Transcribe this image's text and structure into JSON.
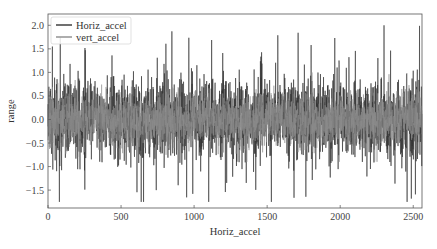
{
  "chart_data": {
    "type": "line",
    "title": "",
    "xlabel": "Horiz_accel",
    "ylabel": "range",
    "xlim": [
      0,
      2560
    ],
    "ylim": [
      -1.88,
      2.24
    ],
    "xticks": [
      0,
      500,
      1000,
      1500,
      2000,
      2500
    ],
    "yticks": [
      -1.5,
      -1.0,
      -0.5,
      0.0,
      0.5,
      1.0,
      1.5,
      2.0
    ],
    "xtick_labels": [
      "0",
      "500",
      "1000",
      "1500",
      "2000",
      "2500"
    ],
    "ytick_labels": [
      "−1.5",
      "−1.0",
      "−0.5",
      "0.0",
      "0.5",
      "1.0",
      "1.5",
      "2.0"
    ],
    "grid": false,
    "legend_position": "upper left",
    "n_points": 2560,
    "series": [
      {
        "name": "Horiz_accel",
        "color": "#333333",
        "summary": {
          "mean": 0.0,
          "typical_range": [
            -1.0,
            1.0
          ],
          "max": 2.0,
          "max_at": 2300,
          "min": -1.75,
          "min_at": 1100
        },
        "generator": {
          "seed": 7,
          "std": 0.42,
          "spike_prob": 0.03,
          "spike_scale": 1.3
        }
      },
      {
        "name": "vert_accel",
        "color": "#8c8c8c",
        "summary": {
          "mean": 0.0,
          "typical_range": [
            -0.6,
            0.6
          ],
          "max": 1.0,
          "min": -0.9
        },
        "generator": {
          "seed": 13,
          "std": 0.27,
          "spike_prob": 0.01,
          "spike_scale": 0.7
        }
      }
    ]
  },
  "legend": {
    "items": [
      {
        "label": "Horiz_accel",
        "color": "#333333"
      },
      {
        "label": "vert_accel",
        "color": "#8c8c8c"
      }
    ]
  },
  "axes": {
    "xlabel": "Horiz_accel",
    "ylabel": "range"
  }
}
